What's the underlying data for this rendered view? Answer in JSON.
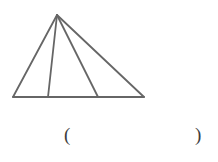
{
  "figure": {
    "name": "triangle-with-two-cevians",
    "background_color": "#ffffff",
    "stroke_color": "#666666",
    "stroke_width": 1.8,
    "canvas": {
      "width": 218,
      "height": 162
    },
    "vertices": {
      "apex": {
        "label": "apex",
        "x": 57,
        "y": 15
      },
      "base_left": {
        "label": "base-left",
        "x": 13,
        "y": 97
      },
      "base_right": {
        "label": "base-right",
        "x": 144,
        "y": 97
      }
    },
    "cevian_feet": [
      {
        "label": "cevian-foot-1",
        "x": 48,
        "y": 97
      },
      {
        "label": "cevian-foot-2",
        "x": 98,
        "y": 97
      }
    ],
    "segments": [
      {
        "name": "left-side",
        "x1": 57,
        "y1": 15,
        "x2": 13,
        "y2": 97
      },
      {
        "name": "right-side",
        "x1": 57,
        "y1": 15,
        "x2": 144,
        "y2": 97
      },
      {
        "name": "base",
        "x1": 13,
        "y1": 97,
        "x2": 144,
        "y2": 97
      },
      {
        "name": "cevian-1",
        "x1": 57,
        "y1": 15,
        "x2": 48,
        "y2": 97
      },
      {
        "name": "cevian-2",
        "x1": 57,
        "y1": 15,
        "x2": 98,
        "y2": 97
      }
    ],
    "sub_triangle_count": 3
  },
  "answer": {
    "open_paren": "(",
    "close_paren": ")",
    "value": ""
  }
}
